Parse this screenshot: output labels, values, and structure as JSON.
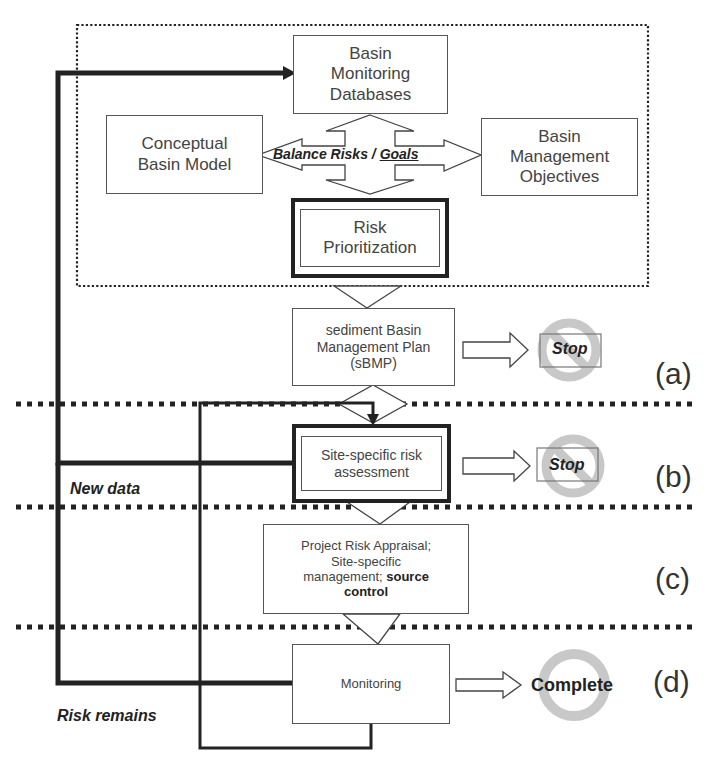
{
  "diagram": {
    "boxes": {
      "monitoring_databases": "Basin\nMonitoring\nDatabases",
      "conceptual_model": "Conceptual\nBasin Model",
      "management_objectives": "Basin\nManagement\nObjectives",
      "risk_prioritization": "Risk\nPrioritization",
      "sbmp": "sediment Basin\nManagement Plan\n(sBMP)",
      "site_specific": "Site-specific risk\nassessment",
      "project_risk_line1": "Project Risk Appraisal;\nSite-specific\nmanagement; ",
      "project_risk_bold": "source\ncontrol",
      "monitoring": "Monitoring"
    },
    "balance_label": {
      "part1": "Balance Risks / ",
      "part2": "Goals"
    },
    "outcomes": {
      "stop_a": "Stop",
      "stop_b": "Stop",
      "complete": "Complete"
    },
    "side_labels": {
      "new_data": "New data",
      "risk_remains": "Risk remains"
    },
    "panels": [
      "(a)",
      "(b)",
      "(c)",
      "(d)"
    ],
    "colors": {
      "line": "#222222",
      "box_border": "#555555",
      "stop_ring": "#c8c8c8"
    }
  }
}
